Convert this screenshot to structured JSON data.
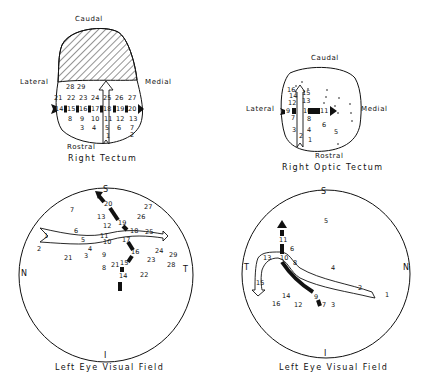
{
  "panels": {
    "right_tectum": {
      "caption": "Right Tectum",
      "labels": {
        "top": "Caudal",
        "bottom": "Rostral",
        "left": "Lateral",
        "right": "Medial"
      },
      "points": [
        {
          "n": "28",
          "x": 69,
          "y": 87
        },
        {
          "n": "29",
          "x": 80,
          "y": 87
        },
        {
          "n": "21",
          "x": 57,
          "y": 98
        },
        {
          "n": "22",
          "x": 70,
          "y": 98
        },
        {
          "n": "23",
          "x": 82,
          "y": 98
        },
        {
          "n": "24",
          "x": 94,
          "y": 98
        },
        {
          "n": "25",
          "x": 106,
          "y": 98
        },
        {
          "n": "26",
          "x": 118,
          "y": 98
        },
        {
          "n": "27",
          "x": 131,
          "y": 98
        },
        {
          "n": "14",
          "x": 58,
          "y": 109
        },
        {
          "n": "15",
          "x": 70,
          "y": 109
        },
        {
          "n": "16",
          "x": 82,
          "y": 109
        },
        {
          "n": "17",
          "x": 94,
          "y": 109
        },
        {
          "n": "18",
          "x": 106,
          "y": 109
        },
        {
          "n": "19",
          "x": 119,
          "y": 109
        },
        {
          "n": "20",
          "x": 131,
          "y": 109
        },
        {
          "n": "8",
          "x": 71,
          "y": 119
        },
        {
          "n": "9",
          "x": 83,
          "y": 119
        },
        {
          "n": "10",
          "x": 94,
          "y": 119
        },
        {
          "n": "11",
          "x": 107,
          "y": 119
        },
        {
          "n": "12",
          "x": 119,
          "y": 119
        },
        {
          "n": "13",
          "x": 132,
          "y": 119
        },
        {
          "n": "3",
          "x": 83,
          "y": 128
        },
        {
          "n": "4",
          "x": 95,
          "y": 128
        },
        {
          "n": "5",
          "x": 108,
          "y": 128
        },
        {
          "n": "6",
          "x": 120,
          "y": 128
        },
        {
          "n": "7",
          "x": 133,
          "y": 128
        },
        {
          "n": "1",
          "x": 109,
          "y": 136
        },
        {
          "n": "2",
          "x": 133,
          "y": 135
        }
      ]
    },
    "right_optic_tectum": {
      "caption": "Right Optic Tectum",
      "labels": {
        "top": "Caudal",
        "bottom": "Rostral",
        "left": "Lateral",
        "right": "Medial"
      },
      "points": [
        {
          "n": "16",
          "x": 290,
          "y": 90
        },
        {
          "n": "14",
          "x": 292,
          "y": 96
        },
        {
          "n": "12",
          "x": 291,
          "y": 103
        },
        {
          "n": "15",
          "x": 305,
          "y": 93
        },
        {
          "n": "13",
          "x": 305,
          "y": 101
        },
        {
          "n": "9",
          "x": 289,
          "y": 111
        },
        {
          "n": "10",
          "x": 306,
          "y": 111
        },
        {
          "n": "11",
          "x": 323,
          "y": 111
        },
        {
          "n": "7",
          "x": 294,
          "y": 118
        },
        {
          "n": "8",
          "x": 310,
          "y": 119
        },
        {
          "n": "6",
          "x": 325,
          "y": 125
        },
        {
          "n": "3",
          "x": 295,
          "y": 130
        },
        {
          "n": "4",
          "x": 310,
          "y": 130
        },
        {
          "n": "5",
          "x": 337,
          "y": 132
        },
        {
          "n": "2",
          "x": 302,
          "y": 136
        },
        {
          "n": "1",
          "x": 311,
          "y": 140
        }
      ]
    },
    "left_eye_field_1": {
      "caption": "Left Eye Visual Field",
      "labels": {
        "top": "S",
        "bottom": "I",
        "left": "N",
        "right": "T"
      },
      "points": [
        {
          "n": "20",
          "x": 107,
          "y": 204
        },
        {
          "n": "7",
          "x": 73,
          "y": 210
        },
        {
          "n": "27",
          "x": 147,
          "y": 207
        },
        {
          "n": "13",
          "x": 100,
          "y": 217
        },
        {
          "n": "26",
          "x": 140,
          "y": 217
        },
        {
          "n": "19",
          "x": 121,
          "y": 223
        },
        {
          "n": "12",
          "x": 106,
          "y": 226
        },
        {
          "n": "6",
          "x": 77,
          "y": 231
        },
        {
          "n": "18",
          "x": 133,
          "y": 231
        },
        {
          "n": "25",
          "x": 148,
          "y": 232
        },
        {
          "n": "1",
          "x": 47,
          "y": 236
        },
        {
          "n": "11",
          "x": 103,
          "y": 236
        },
        {
          "n": "5",
          "x": 84,
          "y": 240
        },
        {
          "n": "17",
          "x": 125,
          "y": 240
        },
        {
          "n": "10",
          "x": 106,
          "y": 242
        },
        {
          "n": "2",
          "x": 40,
          "y": 249
        },
        {
          "n": "4",
          "x": 91,
          "y": 249
        },
        {
          "n": "16",
          "x": 134,
          "y": 252
        },
        {
          "n": "24",
          "x": 158,
          "y": 251
        },
        {
          "n": "29",
          "x": 172,
          "y": 255
        },
        {
          "n": "21",
          "x": 67,
          "y": 258
        },
        {
          "n": "3",
          "x": 87,
          "y": 256
        },
        {
          "n": "9",
          "x": 105,
          "y": 255
        },
        {
          "n": "23",
          "x": 150,
          "y": 260
        },
        {
          "n": "15",
          "x": 123,
          "y": 263
        },
        {
          "n": "21b",
          "label": "21",
          "x": 114,
          "y": 265
        },
        {
          "n": "28",
          "x": 170,
          "y": 265
        },
        {
          "n": "8",
          "x": 105,
          "y": 268
        },
        {
          "n": "14",
          "x": 122,
          "y": 276
        },
        {
          "n": "22",
          "x": 143,
          "y": 275
        }
      ]
    },
    "left_eye_field_2": {
      "caption": "Left Eye Visual Field",
      "labels": {
        "top": "S",
        "bottom": "I",
        "left": "T",
        "right": "N"
      },
      "points": [
        {
          "n": "5",
          "x": 327,
          "y": 221
        },
        {
          "n": "11",
          "x": 282,
          "y": 240
        },
        {
          "n": "6",
          "x": 293,
          "y": 249
        },
        {
          "n": "13",
          "x": 266,
          "y": 258
        },
        {
          "n": "10",
          "x": 283,
          "y": 258
        },
        {
          "n": "8",
          "x": 296,
          "y": 263
        },
        {
          "n": "4",
          "x": 334,
          "y": 268
        },
        {
          "n": "15",
          "x": 259,
          "y": 283
        },
        {
          "n": "2",
          "x": 361,
          "y": 288
        },
        {
          "n": "1",
          "x": 388,
          "y": 295
        },
        {
          "n": "9",
          "x": 317,
          "y": 297
        },
        {
          "n": "14",
          "x": 285,
          "y": 296
        },
        {
          "n": "16",
          "x": 275,
          "y": 304
        },
        {
          "n": "12",
          "x": 297,
          "y": 305
        },
        {
          "n": "7",
          "x": 325,
          "y": 305
        },
        {
          "n": "3",
          "x": 334,
          "y": 305
        }
      ]
    }
  },
  "colors": {
    "ink": "#111111",
    "background": "#ffffff"
  }
}
